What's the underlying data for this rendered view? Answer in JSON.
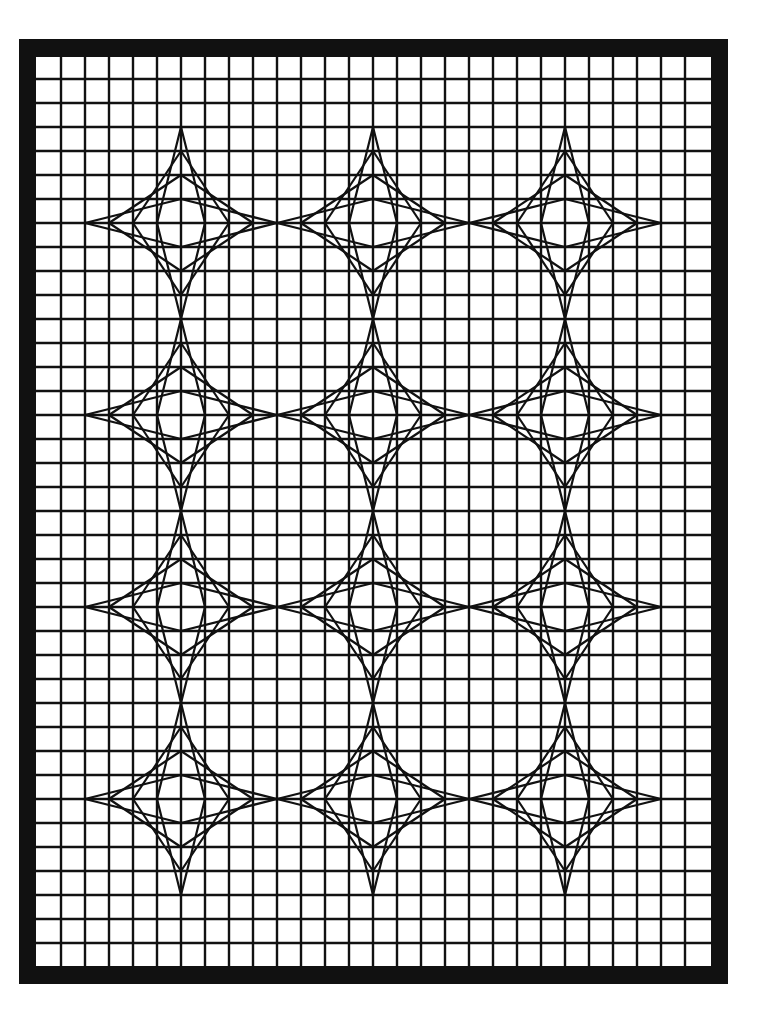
{
  "artwork": {
    "title": "String-art star pattern on grid paper",
    "colors": {
      "ink": "#111111",
      "paper": "#ffffff",
      "background": "#ffffff"
    },
    "grid": {
      "columns": 28,
      "rows": 38
    },
    "stars": {
      "rows": 4,
      "columns": 3,
      "count": 12,
      "strings_per_quadrant": 4,
      "radius_in_cells": 4,
      "spacing_in_cells": 8
    }
  }
}
